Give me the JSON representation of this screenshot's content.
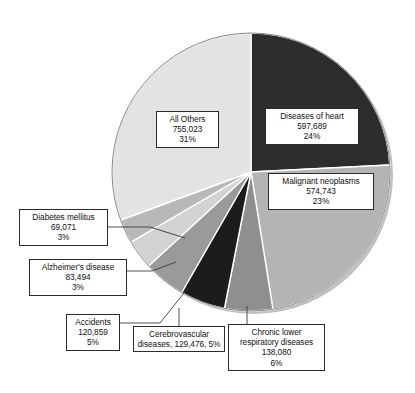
{
  "chart_data": {
    "type": "pie",
    "title": "",
    "subtitle": "",
    "xlabel": "",
    "ylabel": "",
    "legend_position": "none",
    "grid": false,
    "start_angle_deg": 0,
    "direction": "clockwise",
    "total": 2468435,
    "categories": [
      "Diseases of heart",
      "Malignant neoplasms",
      "Chronic lower respiratory diseases",
      "Cerebrovascular diseases",
      "Accidents",
      "Alzheimer's disease",
      "Diabetes mellitus",
      "All Others"
    ],
    "values": [
      597689,
      574743,
      138080,
      129476,
      120859,
      83494,
      69071,
      755023
    ],
    "percents": [
      24,
      23,
      6,
      5,
      5,
      3,
      3,
      31
    ],
    "colors": [
      "#2d2d2d",
      "#b4b4b4",
      "#8f8f8f",
      "#1c1c1c",
      "#9a9a9a",
      "#d2d2d2",
      "#b8b8b8",
      "#e3e3e3"
    ],
    "slices": [
      {
        "name": "Diseases of heart",
        "label": "Diseases of heart",
        "value": 597689,
        "value_text": "597,689",
        "percent": 24,
        "percent_text": "24%",
        "color": "#2d2d2d",
        "start_deg": 0,
        "sweep_deg": 87.1
      },
      {
        "name": "Malignant neoplasms",
        "label": "Malignant neoplasms",
        "value": 574743,
        "value_text": "574,743",
        "percent": 23,
        "percent_text": "23%",
        "color": "#b4b4b4",
        "start_deg": 87.1,
        "sweep_deg": 83.8
      },
      {
        "name": "Chronic lower respiratory diseases",
        "label": "Chronic lower respiratory diseases",
        "label_line1": "Chronic lower",
        "label_line2": "respiratory diseases",
        "value": 138080,
        "value_text": "138,080",
        "percent": 6,
        "percent_text": "6%",
        "color": "#8f8f8f",
        "start_deg": 170.9,
        "sweep_deg": 20.1
      },
      {
        "name": "Cerebrovascular diseases",
        "label": "Cerebrovascular diseases",
        "label_line1": "Cerebrovascular",
        "label_line2": "diseases, 129,476, 5%",
        "value": 129476,
        "value_text": "129,476",
        "percent": 5,
        "percent_text": "5%",
        "color": "#1c1c1c",
        "start_deg": 191.0,
        "sweep_deg": 18.9
      },
      {
        "name": "Accidents",
        "label": "Accidents",
        "value": 120859,
        "value_text": "120,859",
        "percent": 5,
        "percent_text": "5%",
        "color": "#9a9a9a",
        "start_deg": 209.9,
        "sweep_deg": 17.6
      },
      {
        "name": "Alzheimer's disease",
        "label": "Alzheimer's disease",
        "value": 83494,
        "value_text": "83,494",
        "percent": 3,
        "percent_text": "3%",
        "color": "#d2d2d2",
        "start_deg": 227.5,
        "sweep_deg": 12.2
      },
      {
        "name": "Diabetes mellitus",
        "label": "Diabetes mellitus",
        "value": 69071,
        "value_text": "69,071",
        "percent": 3,
        "percent_text": "3%",
        "color": "#b8b8b8",
        "start_deg": 239.7,
        "sweep_deg": 10.1
      },
      {
        "name": "All Others",
        "label": "All Others",
        "value": 755023,
        "value_text": "755,023",
        "percent": 31,
        "percent_text": "31%",
        "color": "#e3e3e3",
        "start_deg": 249.8,
        "sweep_deg": 110.2
      }
    ]
  },
  "callouts": {
    "heart": {
      "line1": "Diseases of heart",
      "line2": "597,689",
      "line3": "24%"
    },
    "neoplasms": {
      "line1": "Malignant neoplasms",
      "line2": "574,743",
      "line3": "23%"
    },
    "all_others": {
      "line1": "All Others",
      "line2": "755,023",
      "line3": "31%"
    },
    "diabetes": {
      "line1": "Diabetes mellitus",
      "line2": "69,071",
      "line3": "3%"
    },
    "alzheimers": {
      "line1": "Alzheimer's disease",
      "line2": "83,494",
      "line3": "3%"
    },
    "accidents": {
      "line1": "Accidents",
      "line2": "120,859",
      "line3": "5%"
    },
    "cerebro": {
      "line1": "Cerebrovascular",
      "line2": "diseases, 129,476, 5%",
      "line3": ""
    },
    "chronic": {
      "line1": "Chronic lower",
      "line2": "respiratory diseases",
      "line3": "138,080",
      "line4": "6%"
    }
  }
}
